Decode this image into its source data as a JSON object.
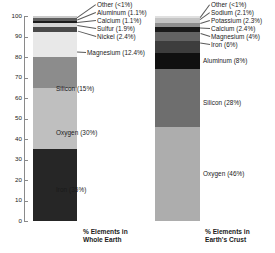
{
  "chart_data": {
    "type": "bar",
    "title": "",
    "subtitle": "",
    "xlabel": "",
    "ylabel": "",
    "ylim": [
      0,
      100
    ],
    "grid": false,
    "legend": "none",
    "orientation": "vertical-stacked",
    "categories": [
      "% Elements in Whole Earth",
      "% Elements in Earth's Crust"
    ],
    "series": [
      {
        "name": "% Elements in Whole Earth",
        "caption_line1": "% Elements in",
        "caption_line2": "Whole Earth",
        "segments": [
          {
            "label": "Iron (35%)",
            "element": "Iron",
            "value": 35,
            "value_text": "35%",
            "color": "#262626"
          },
          {
            "label": "Oxygen (30%)",
            "element": "Oxygen",
            "value": 30,
            "value_text": "30%",
            "color": "#bfbfbf"
          },
          {
            "label": "Silicon (15%)",
            "element": "Silicon",
            "value": 15,
            "value_text": "15%",
            "color": "#8c8c8c"
          },
          {
            "label": "Magnesium (12.4%)",
            "element": "Magnesium",
            "value": 12.4,
            "value_text": "12.4%",
            "color": "#e8e8e8"
          },
          {
            "label": "Nickel (2.4%)",
            "element": "Nickel",
            "value": 2.4,
            "value_text": "2.4%",
            "color": "#4a4a4a"
          },
          {
            "label": "Sulfur (1.9%)",
            "element": "Sulfur",
            "value": 1.9,
            "value_text": "1.9%",
            "color": "#d4d4d4"
          },
          {
            "label": "Calcium (1.1%)",
            "element": "Calcium",
            "value": 1.1,
            "value_text": "1.1%",
            "color": "#1c1c1c"
          },
          {
            "label": "Aluminum (1.1%)",
            "element": "Aluminum",
            "value": 1.1,
            "value_text": "1.1%",
            "color": "#5e5e5e"
          },
          {
            "label": "Other (<1%)",
            "element": "Other",
            "value": 1.1,
            "value_text": "<1%",
            "color": "#c9c9c9"
          }
        ]
      },
      {
        "name": "% Elements in Earth's Crust",
        "caption_line1": "% Elements in",
        "caption_line2": "Earth's Crust",
        "segments": [
          {
            "label": "Oxygen (46%)",
            "element": "Oxygen",
            "value": 46,
            "value_text": "46%",
            "color": "#adadad"
          },
          {
            "label": "Silicon (28%)",
            "element": "Silicon",
            "value": 28,
            "value_text": "28%",
            "color": "#6e6e6e"
          },
          {
            "label": "Aluminum (8%)",
            "element": "Aluminum",
            "value": 8,
            "value_text": "8%",
            "color": "#101010"
          },
          {
            "label": "Iron (6%)",
            "element": "Iron",
            "value": 6,
            "value_text": "6%",
            "color": "#3d3d3d"
          },
          {
            "label": "Magnesium (4%)",
            "element": "Magnesium",
            "value": 4,
            "value_text": "4%",
            "color": "#636363"
          },
          {
            "label": "Calcium (2.4%)",
            "element": "Calcium",
            "value": 2.4,
            "value_text": "2.4%",
            "color": "#1a1a1a"
          },
          {
            "label": "Potassium (2.3%)",
            "element": "Potassium",
            "value": 2.3,
            "value_text": "2.3%",
            "color": "#8f8f8f"
          },
          {
            "label": "Sodium (2.1%)",
            "element": "Sodium",
            "value": 2.1,
            "value_text": "2.1%",
            "color": "#c4c4c4"
          },
          {
            "label": "Other (<1%)",
            "element": "Other",
            "value": 1.2,
            "value_text": "<1%",
            "color": "#e0e0e0"
          }
        ]
      }
    ],
    "yaxis": {
      "min": 0,
      "max": 100,
      "step": 10,
      "ticks": [
        "0",
        "10",
        "20",
        "30",
        "40",
        "50",
        "60",
        "70",
        "80",
        "90",
        "100"
      ]
    }
  },
  "axis": {
    "ticks": [
      {
        "text": "100"
      },
      {
        "text": "90"
      },
      {
        "text": "80"
      },
      {
        "text": "70"
      },
      {
        "text": "60"
      },
      {
        "text": "50"
      },
      {
        "text": "40"
      },
      {
        "text": "30"
      },
      {
        "text": "20"
      },
      {
        "text": "10"
      },
      {
        "text": "0"
      }
    ]
  },
  "left_labels": [
    {
      "text": "Other (<1%)"
    },
    {
      "text": "Aluminum (1.1%)"
    },
    {
      "text": "Calcium (1.1%)"
    },
    {
      "text": "Sulfur (1.9%)"
    },
    {
      "text": "Nickel (2.4%)"
    },
    {
      "text": "Magnesium (12.4%)"
    },
    {
      "text": "Silicon (15%)"
    },
    {
      "text": "Oxygen (30%)"
    },
    {
      "text": "Iron (35%)"
    }
  ],
  "right_labels": [
    {
      "text": "Other (<1%)"
    },
    {
      "text": "Sodium (2.1%)"
    },
    {
      "text": "Potassium (2.3%)"
    },
    {
      "text": "Calcium (2.4%)"
    },
    {
      "text": "Magnesium (4%)"
    },
    {
      "text": "Iron (6%)"
    },
    {
      "text": "Aluminum (8%)"
    },
    {
      "text": "Silicon (28%)"
    },
    {
      "text": "Oxygen (46%)"
    }
  ],
  "captions": {
    "left_line1": "% Elements in",
    "left_line2": "Whole Earth",
    "right_line1": "% Elements in",
    "right_line2": "Earth's Crust"
  }
}
